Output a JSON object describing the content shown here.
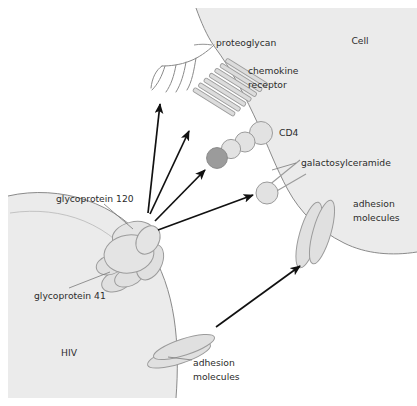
{
  "figure": {
    "background_color": "#ffffff",
    "cell_fill": "#ebebeb",
    "virus_fill": "#ebebeb",
    "membrane_stroke": "#8a8a8a",
    "molecule_fill": "#dcdcdc",
    "molecule_stroke": "#9b9b9b",
    "highlight_fill": "#9b9b9b",
    "arrow_color": "#111111",
    "text_color": "#2b2b2b"
  },
  "labels": {
    "cell": "Cell",
    "hiv": "HIV",
    "proteoglycan": "proteoglycan",
    "chemokine_receptor_line1": "chemokine",
    "chemokine_receptor_line2": "receptor",
    "cd4": "CD4",
    "galactosylceramide": "galactosylceramide",
    "adhesion_molecules_cell_line1": "adhesion",
    "adhesion_molecules_cell_line2": "molecules",
    "adhesion_molecules_virus_line1": "adhesion",
    "adhesion_molecules_virus_line2": "molecules",
    "glycoprotein_120": "glycoprotein 120",
    "glycoprotein_41": "glycoprotein 41"
  },
  "structures": {
    "cell_region": "host cell upper-right, light gray filled, curved membrane",
    "virus_region": "HIV particle lower-left, light gray filled, curved membrane",
    "proteoglycan": "branched curved filament chains on cell surface",
    "chemokine_receptor": "seven parallel transmembrane bars",
    "cd4": "chain of four circles, lowest circle shaded dark",
    "galactosylceramide": "circle head with two lipid tail lines",
    "adhesion_molecules_cell": "two overlapping elongated ellipses spanning cell membrane",
    "adhesion_molecules_virus": "two overlapping elongated ellipses spanning virus membrane",
    "glycoprotein_complex": "cluster of overlapping ellipses forming gp120 knob and gp41 stalk"
  },
  "arrows": [
    {
      "name": "arrow-to-proteoglycan",
      "from": "glycoprotein-complex",
      "to": "proteoglycan"
    },
    {
      "name": "arrow-to-chemokine-receptor",
      "from": "glycoprotein-complex",
      "to": "chemokine-receptor"
    },
    {
      "name": "arrow-to-cd4",
      "from": "glycoprotein-complex",
      "to": "cd4"
    },
    {
      "name": "arrow-to-galactosylceramide",
      "from": "glycoprotein-complex",
      "to": "galactosylceramide"
    },
    {
      "name": "arrow-to-adhesion-molecules",
      "from": "adhesion-molecules-virus",
      "to": "adhesion-molecules-cell"
    }
  ]
}
